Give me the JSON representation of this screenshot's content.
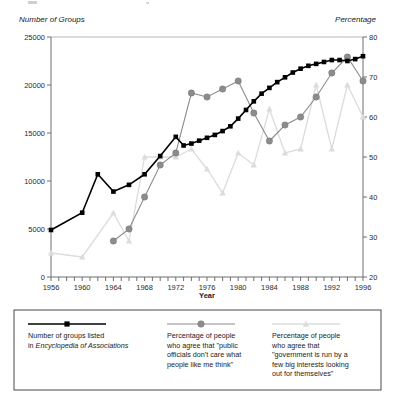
{
  "figure": {
    "left_axis_title": "Number of Groups",
    "right_axis_title": "Percentage",
    "x_axis_title": "Year"
  },
  "legend": {
    "items": [
      {
        "marker": "black-square-marker",
        "lines": [
          "Number of groups listed",
          "in Encyclopedia of Associations"
        ],
        "italic_line_index": 1,
        "italic_part": "Encyclopedia of Associations",
        "color": "#000000"
      },
      {
        "marker": "gray-circle-marker",
        "lines": [
          "Percentage of people",
          "who agree that \"public",
          "officials don't care what",
          "people like me think\""
        ],
        "color": "#8c8c8c"
      },
      {
        "marker": "light-gray-triangle-marker",
        "lines": [
          "Percentage of people",
          "who agree that",
          "\"government is run by a",
          "few big interests looking",
          "out for themselves\""
        ],
        "color": "#dcdcdc"
      }
    ]
  },
  "chart_data": {
    "type": "line",
    "title": "",
    "xlabel": "Year",
    "ylabel": "Number of Groups",
    "y2label": "Percentage",
    "xlim": [
      1956,
      1996
    ],
    "ylim": [
      0,
      25000
    ],
    "y2lim": [
      20,
      80
    ],
    "yticks": [
      0,
      5000,
      10000,
      15000,
      20000,
      25000
    ],
    "y2ticks": [
      20,
      30,
      40,
      50,
      60,
      70,
      80
    ],
    "xticks_labeled": [
      1956,
      1960,
      1964,
      1968,
      1972,
      1976,
      1980,
      1984,
      1988,
      1992,
      1996
    ],
    "xtick_interval": 1,
    "grid": false,
    "legend_position": "below-plot",
    "series": [
      {
        "name": "Number of groups listed in Encyclopedia of Associations",
        "axis": "left",
        "color": "#000000",
        "marker": "square",
        "x": [
          1956,
          1960,
          1962,
          1964,
          1966,
          1968,
          1970,
          1972,
          1973,
          1974,
          1975,
          1976,
          1977,
          1978,
          1979,
          1980,
          1981,
          1982,
          1983,
          1984,
          1985,
          1986,
          1987,
          1988,
          1989,
          1990,
          1991,
          1992,
          1993,
          1994,
          1995,
          1996
        ],
        "values": [
          4900,
          6700,
          10700,
          8900,
          9600,
          10700,
          12600,
          14600,
          13700,
          13900,
          14200,
          14500,
          14800,
          15200,
          15700,
          16500,
          17400,
          18300,
          19100,
          19700,
          20300,
          20800,
          21300,
          21700,
          22000,
          22200,
          22400,
          22600,
          22600,
          22500,
          22700,
          23000
        ]
      },
      {
        "name": "Percentage of people who agree that \"public officials don't care what people like me think\"",
        "axis": "right",
        "color": "#8c8c8c",
        "marker": "circle",
        "x": [
          1964,
          1966,
          1968,
          1970,
          1972,
          1974,
          1976,
          1978,
          1980,
          1982,
          1984,
          1986,
          1988,
          1990,
          1992,
          1994,
          1996
        ],
        "values": [
          29,
          32,
          40,
          48,
          51,
          66,
          65,
          67,
          69,
          61,
          54,
          58,
          60,
          65,
          71,
          75,
          69
        ]
      },
      {
        "name": "Percentage of people who agree that \"government is run by a few big interests looking out for themselves\"",
        "axis": "right",
        "color": "#dcdcdc",
        "marker": "triangle",
        "x": [
          1956,
          1960,
          1964,
          1966,
          1968,
          1970,
          1972,
          1974,
          1976,
          1978,
          1980,
          1982,
          1984,
          1986,
          1988,
          1990,
          1992,
          1994,
          1996
        ],
        "values": [
          26,
          25,
          36,
          29,
          50,
          50,
          50,
          52,
          47,
          41,
          51,
          48,
          62,
          51,
          52,
          68,
          52,
          68,
          60
        ]
      }
    ]
  }
}
